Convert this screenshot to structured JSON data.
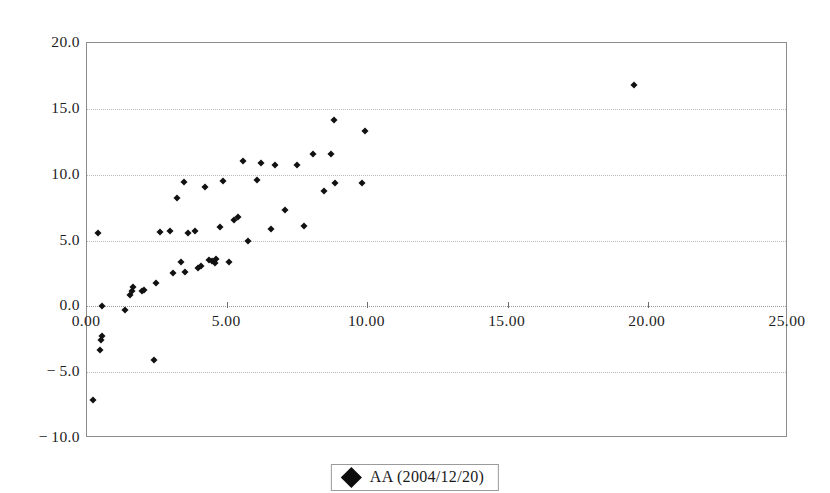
{
  "chart_data": {
    "type": "scatter",
    "title": "",
    "xlabel": "",
    "ylabel": "",
    "xlim": [
      0.0,
      25.0
    ],
    "ylim": [
      -10.0,
      20.0
    ],
    "grid": true,
    "grid_axis": "y",
    "legend_position": "bottom-center",
    "x_ticks": [
      0.0,
      5.0,
      10.0,
      15.0,
      20.0,
      25.0
    ],
    "x_tick_labels": [
      "0.00",
      "5.00",
      "10.00",
      "15.00",
      "20.00",
      "25.00"
    ],
    "y_ticks": [
      -10.0,
      -5.0,
      0.0,
      5.0,
      10.0,
      15.0,
      20.0
    ],
    "y_tick_labels": [
      "-10.0",
      "-5.0",
      "0.0",
      "5.0",
      "10.0",
      "15.0",
      "20.0"
    ],
    "series": [
      {
        "name": "AA (2004/12/20)",
        "marker": "diamond",
        "color": "#111111",
        "points": [
          [
            0.2,
            -7.1
          ],
          [
            0.45,
            -3.35
          ],
          [
            0.5,
            -2.55
          ],
          [
            0.55,
            -2.25
          ],
          [
            0.4,
            5.55
          ],
          [
            0.55,
            0.0
          ],
          [
            1.35,
            -0.25
          ],
          [
            1.55,
            0.85
          ],
          [
            1.6,
            1.2
          ],
          [
            1.65,
            1.45
          ],
          [
            1.95,
            1.15
          ],
          [
            2.05,
            1.25
          ],
          [
            2.4,
            -4.05
          ],
          [
            2.45,
            1.75
          ],
          [
            2.6,
            5.65
          ],
          [
            2.95,
            5.7
          ],
          [
            3.05,
            2.55
          ],
          [
            3.2,
            8.2
          ],
          [
            3.35,
            3.35
          ],
          [
            3.45,
            9.45
          ],
          [
            3.5,
            2.6
          ],
          [
            3.6,
            5.55
          ],
          [
            3.85,
            5.75
          ],
          [
            3.95,
            2.9
          ],
          [
            4.05,
            3.05
          ],
          [
            4.2,
            9.05
          ],
          [
            4.35,
            3.55
          ],
          [
            4.45,
            3.45
          ],
          [
            4.55,
            3.3
          ],
          [
            4.6,
            3.6
          ],
          [
            4.75,
            6.05
          ],
          [
            4.85,
            9.55
          ],
          [
            5.05,
            3.4
          ],
          [
            5.25,
            6.55
          ],
          [
            5.4,
            6.8
          ],
          [
            5.55,
            11.05
          ],
          [
            5.75,
            4.95
          ],
          [
            6.05,
            9.6
          ],
          [
            6.2,
            10.85
          ],
          [
            6.55,
            5.85
          ],
          [
            6.7,
            10.75
          ],
          [
            7.05,
            7.35
          ],
          [
            7.5,
            10.75
          ],
          [
            7.75,
            6.1
          ],
          [
            8.05,
            11.55
          ],
          [
            8.45,
            8.75
          ],
          [
            8.7,
            11.6
          ],
          [
            8.8,
            14.15
          ],
          [
            8.85,
            9.35
          ],
          [
            9.8,
            9.35
          ],
          [
            9.9,
            13.3
          ],
          [
            19.5,
            16.8
          ]
        ]
      }
    ]
  },
  "legend": {
    "label": "AA (2004/12/20)",
    "marker_icon": "diamond-marker-icon"
  },
  "axes": {
    "y_labels": [
      "20.0",
      "15.0",
      "10.0",
      "5.0",
      "0.0",
      "-5.0",
      "-10.0"
    ],
    "x_labels": [
      "0.00",
      "5.00",
      "10.00",
      "15.00",
      "20.00",
      "25.00"
    ]
  }
}
